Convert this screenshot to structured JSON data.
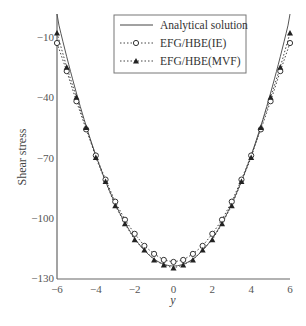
{
  "chart_data": {
    "type": "line",
    "title": "",
    "xlabel": "y",
    "ylabel": "Shear stress",
    "xlim": [
      -6,
      6
    ],
    "ylim": [
      -130,
      0
    ],
    "xticks": [
      -6,
      -4,
      -2,
      0,
      2,
      4,
      6
    ],
    "yticks": [
      -10,
      -40,
      -70,
      -100,
      -130
    ],
    "grid": false,
    "legend_position": "upper center",
    "x": [
      -6,
      -5.5,
      -5,
      -4.5,
      -4,
      -3.5,
      -3,
      -2.5,
      -2,
      -1.5,
      -1,
      -0.5,
      0,
      0.5,
      1,
      1.5,
      2,
      2.5,
      3,
      3.5,
      4,
      4.5,
      5,
      5.5,
      6
    ],
    "series": [
      {
        "name": "Analytical solution",
        "style": "solid",
        "marker": "none",
        "values": [
          0,
          -20.7,
          -39.6,
          -54.3,
          -68.9,
          -81.8,
          -93,
          -102.5,
          -110.2,
          -116.2,
          -120.6,
          -123.1,
          -124,
          -123.1,
          -120.6,
          -116.2,
          -110.2,
          -102.5,
          -93,
          -81.8,
          -68.9,
          -54.3,
          -39.6,
          -20.7,
          0
        ]
      },
      {
        "name": "EFG/HBE(IE)",
        "style": "dotted",
        "marker": "circle-square",
        "values": [
          -13,
          -27,
          -42,
          -56,
          -69,
          -81,
          -92,
          -101,
          -108,
          -114,
          -118,
          -121,
          -122,
          -121,
          -118,
          -114,
          -108,
          -101,
          -92,
          -81,
          -69,
          -56,
          -42,
          -27,
          -13
        ]
      },
      {
        "name": "EFG/HBE(MVF)",
        "style": "dotted",
        "marker": "triangle",
        "values": [
          -8,
          -25,
          -40,
          -55,
          -70,
          -82,
          -94,
          -103,
          -111,
          -116,
          -121,
          -123.5,
          -125,
          -123.5,
          -121,
          -116,
          -111,
          -103,
          -94,
          -82,
          -70,
          -55,
          -40,
          -25,
          -8
        ]
      }
    ]
  }
}
